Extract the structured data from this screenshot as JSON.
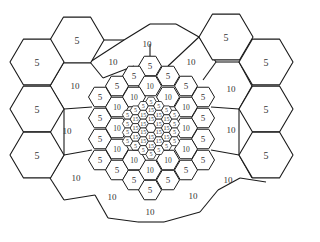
{
  "diagram": {
    "colors": {
      "stroke": "#1a1a1a",
      "fill": "#ffffff",
      "text": "#333333"
    },
    "levels": [
      {
        "name": "outer",
        "label_values": [
          "5"
        ]
      },
      {
        "name": "transition",
        "label_values": [
          "10"
        ]
      },
      {
        "name": "medium",
        "label_values": [
          "5",
          "10"
        ]
      },
      {
        "name": "small",
        "label_values": [
          "5",
          "10"
        ]
      },
      {
        "name": "center",
        "label_values": [
          "15"
        ]
      }
    ],
    "outer_hexes": [
      {
        "cx": 77,
        "cy": 40,
        "label": "5"
      },
      {
        "cx": 37,
        "cy": 62,
        "label": "5"
      },
      {
        "cx": 37,
        "cy": 109,
        "label": "5"
      },
      {
        "cx": 37,
        "cy": 155,
        "label": "5"
      },
      {
        "cx": 226,
        "cy": 37,
        "label": "5"
      },
      {
        "cx": 266,
        "cy": 62,
        "label": "5"
      },
      {
        "cx": 266,
        "cy": 109,
        "label": "5"
      },
      {
        "cx": 266,
        "cy": 155,
        "label": "5"
      }
    ],
    "transition_labels": [
      {
        "x": 113,
        "y": 62,
        "label": "10"
      },
      {
        "x": 75,
        "y": 86,
        "label": "10"
      },
      {
        "x": 67,
        "y": 131,
        "label": "10"
      },
      {
        "x": 76,
        "y": 178,
        "label": "10"
      },
      {
        "x": 112,
        "y": 197,
        "label": "10"
      },
      {
        "x": 147,
        "y": 44,
        "label": "10"
      },
      {
        "x": 191,
        "y": 62,
        "label": "10"
      },
      {
        "x": 231,
        "y": 89,
        "label": "10"
      },
      {
        "x": 231,
        "y": 130,
        "label": "10"
      },
      {
        "x": 228,
        "y": 180,
        "label": "10"
      },
      {
        "x": 193,
        "y": 196,
        "label": "10"
      },
      {
        "x": 150,
        "y": 212,
        "label": "10"
      }
    ],
    "medium_hexes": [
      {
        "cx": 150,
        "cy": 66,
        "label": "5"
      },
      {
        "cx": 134,
        "cy": 76,
        "label": "5"
      },
      {
        "cx": 168,
        "cy": 76,
        "label": "5"
      },
      {
        "cx": 117,
        "cy": 86,
        "label": "5"
      },
      {
        "cx": 186,
        "cy": 86,
        "label": "5"
      },
      {
        "cx": 100,
        "cy": 97,
        "label": "5"
      },
      {
        "cx": 203,
        "cy": 97,
        "label": "5"
      },
      {
        "cx": 100,
        "cy": 118,
        "label": "5"
      },
      {
        "cx": 203,
        "cy": 118,
        "label": "5"
      },
      {
        "cx": 100,
        "cy": 139,
        "label": "5"
      },
      {
        "cx": 203,
        "cy": 139,
        "label": "5"
      },
      {
        "cx": 100,
        "cy": 160,
        "label": "5"
      },
      {
        "cx": 203,
        "cy": 160,
        "label": "5"
      },
      {
        "cx": 117,
        "cy": 170,
        "label": "5"
      },
      {
        "cx": 186,
        "cy": 170,
        "label": "5"
      },
      {
        "cx": 134,
        "cy": 180,
        "label": "5"
      },
      {
        "cx": 168,
        "cy": 180,
        "label": "5"
      },
      {
        "cx": 150,
        "cy": 190,
        "label": "5"
      },
      {
        "cx": 150,
        "cy": 86,
        "label": "10"
      },
      {
        "cx": 186,
        "cy": 107,
        "label": "10"
      },
      {
        "cx": 186,
        "cy": 149,
        "label": "10"
      },
      {
        "cx": 150,
        "cy": 170,
        "label": "10"
      },
      {
        "cx": 117,
        "cy": 149,
        "label": "10"
      },
      {
        "cx": 117,
        "cy": 107,
        "label": "10"
      },
      {
        "cx": 134,
        "cy": 97,
        "label": "10"
      },
      {
        "cx": 168,
        "cy": 97,
        "label": "10"
      },
      {
        "cx": 134,
        "cy": 160,
        "label": "10"
      },
      {
        "cx": 168,
        "cy": 160,
        "label": "10"
      },
      {
        "cx": 117,
        "cy": 128,
        "label": "10"
      },
      {
        "cx": 186,
        "cy": 128,
        "label": "10"
      }
    ],
    "center_cluster": {
      "cx": 151,
      "cy": 128,
      "radius": 5.2,
      "rings": 3,
      "ring_labels": [
        "",
        "15",
        "15",
        "5"
      ]
    }
  }
}
